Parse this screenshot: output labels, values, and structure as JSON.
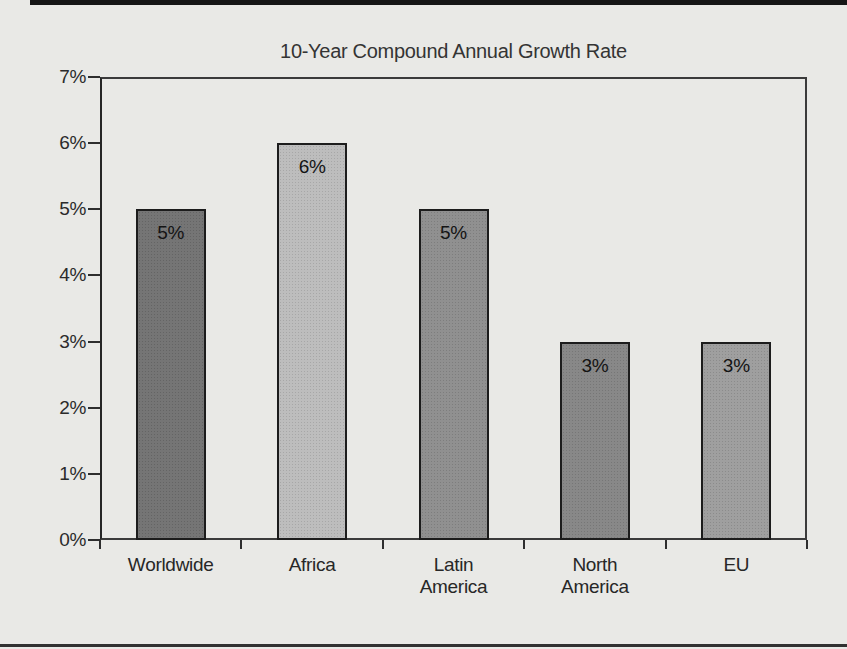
{
  "page": {
    "background_color": "#e9e9e6",
    "top_rule_color": "#161616",
    "bottom_rule_color": "#313131"
  },
  "chart_data": {
    "type": "bar",
    "title": "10-Year Compound Annual Growth Rate",
    "categories": [
      "Worldwide",
      "Africa",
      "Latin\nAmerica",
      "North\nAmerica",
      "EU"
    ],
    "values": [
      5,
      6,
      5,
      3,
      3
    ],
    "bar_labels": [
      "5%",
      "6%",
      "5%",
      "3%",
      "3%"
    ],
    "bar_colors": [
      "#6f6f6f",
      "#bababa",
      "#8b8b8b",
      "#838383",
      "#9b9b9b"
    ],
    "bar_border_color": "#1c1c1c",
    "y_ticks": [
      "0%",
      "1%",
      "2%",
      "3%",
      "4%",
      "5%",
      "6%",
      "7%"
    ],
    "ylim": [
      0,
      7
    ],
    "xlabel": "",
    "ylabel": "",
    "grid": false,
    "legend": null,
    "frame_color": "#3b3b3b",
    "text_color": "#2b2b2b"
  }
}
